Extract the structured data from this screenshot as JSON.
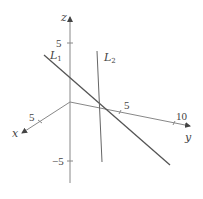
{
  "figure": {
    "axes": {
      "x": {
        "label": "x",
        "ticks": [
          {
            "value": "5"
          }
        ]
      },
      "y": {
        "label": "y",
        "ticks": [
          {
            "value": "5"
          },
          {
            "value": "10"
          }
        ]
      },
      "z": {
        "label": "z",
        "ticks": [
          {
            "value": "5"
          },
          {
            "value": "−5"
          }
        ]
      }
    },
    "lines": [
      {
        "name": "L",
        "subscript": "1"
      },
      {
        "name": "L",
        "subscript": "2"
      }
    ],
    "colors": {
      "axes": "#888888",
      "line_L1": "#555555",
      "line_L2": "#666666",
      "text": "#444444"
    }
  }
}
